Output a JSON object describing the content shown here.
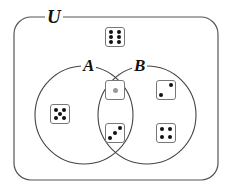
{
  "diagram": {
    "type": "venn",
    "universe_label": "U",
    "sets": [
      {
        "label": "A",
        "elements": [
          5,
          1,
          3
        ]
      },
      {
        "label": "B",
        "elements": [
          1,
          3,
          2,
          4
        ]
      }
    ],
    "outside_elements": [
      6
    ],
    "colors": {
      "stroke": "#555555",
      "pip": "#111111",
      "center_pip": "#999999",
      "background": "#ffffff"
    }
  },
  "dice": [
    {
      "value": 6,
      "region": "U only"
    },
    {
      "value": 5,
      "region": "A only"
    },
    {
      "value": 1,
      "region": "A and B"
    },
    {
      "value": 3,
      "region": "A and B"
    },
    {
      "value": 2,
      "region": "B only"
    },
    {
      "value": 4,
      "region": "B only"
    }
  ]
}
